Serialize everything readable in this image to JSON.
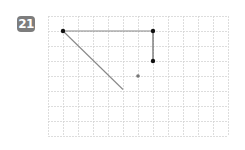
{
  "problem": {
    "number": "21"
  },
  "grid": {
    "left": 48,
    "top": 16,
    "cell": 15,
    "cols": 12,
    "rows": 8,
    "line_color": "#d4d4d4"
  },
  "figure": {
    "segments": [
      {
        "from": [
          1,
          1
        ],
        "to": [
          7,
          1
        ],
        "color": "#888888"
      },
      {
        "from": [
          7,
          1
        ],
        "to": [
          7,
          3
        ],
        "color": "#555555"
      },
      {
        "from": [
          1,
          1
        ],
        "to": [
          5,
          4.9
        ],
        "color": "#888888"
      }
    ],
    "points": [
      {
        "at": [
          1,
          1
        ],
        "color": "#111111",
        "r": 2.2
      },
      {
        "at": [
          7,
          1
        ],
        "color": "#111111",
        "r": 2.2
      },
      {
        "at": [
          7,
          3
        ],
        "color": "#111111",
        "r": 2.2
      },
      {
        "at": [
          6,
          4
        ],
        "color": "#777777",
        "r": 1.8
      }
    ]
  }
}
